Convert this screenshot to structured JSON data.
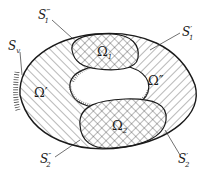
{
  "diagram": {
    "type": "domain decomposition schematic",
    "colors": {
      "stroke": "#1a1a1a",
      "hatch": "#333333",
      "background": "#ffffff"
    },
    "regions": [
      {
        "id": "omega1",
        "symbol": "Ω",
        "sub": "1",
        "fill": "crosshatch"
      },
      {
        "id": "omega2",
        "symbol": "Ω",
        "sub": "2",
        "fill": "crosshatch"
      },
      {
        "id": "omega_prime",
        "symbol": "Ω′",
        "fill": "diagonal-hatch-left"
      },
      {
        "id": "omega_dprime",
        "symbol": "Ω″",
        "fill": "diagonal-hatch-right"
      },
      {
        "id": "hole",
        "fill": "none"
      }
    ],
    "labels": {
      "s1_triple": {
        "base": "S",
        "sup": "‴",
        "sub": "1"
      },
      "s1_prime": {
        "base": "S",
        "sup": "′",
        "sub": "1"
      },
      "sv": {
        "base": "S",
        "sub": "v"
      },
      "omega_prime": {
        "text": "Ω′"
      },
      "omega_dprime": {
        "text": "Ω″"
      },
      "omega1": {
        "base": "Ω",
        "sub": "1"
      },
      "omega2": {
        "base": "Ω",
        "sub": "2"
      },
      "s2_dprime": {
        "base": "S",
        "sup": "″",
        "sub": "2"
      },
      "s2_prime": {
        "base": "S",
        "sup": "′",
        "sub": "2"
      }
    }
  }
}
